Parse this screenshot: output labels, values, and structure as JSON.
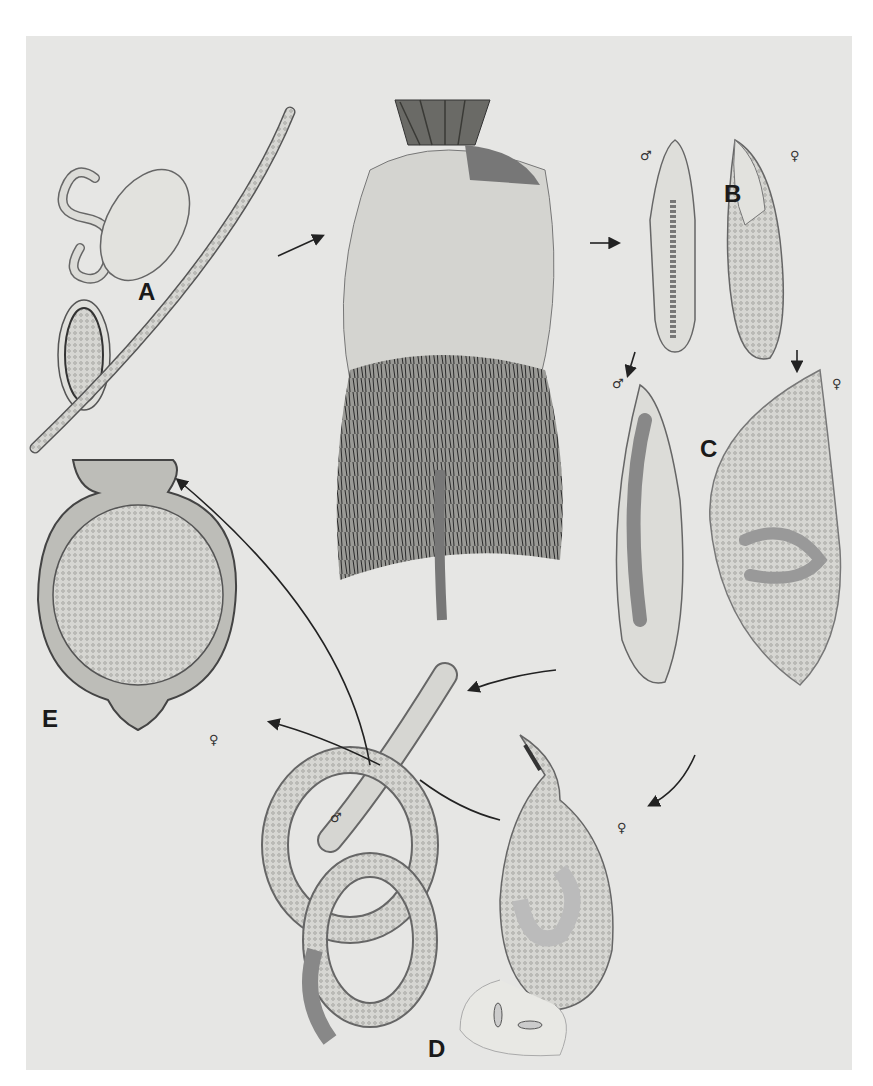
{
  "figure": {
    "stage_labels": {
      "A": "A",
      "B": "B",
      "C": "C",
      "D": "D",
      "E": "E"
    },
    "sex_symbols": {
      "male": "♂",
      "female": "♀"
    },
    "colors": {
      "background": "#e6e6e4",
      "ink": "#1a1a1a",
      "outline": "#555555",
      "body_fill": "#d8d8d4"
    }
  }
}
